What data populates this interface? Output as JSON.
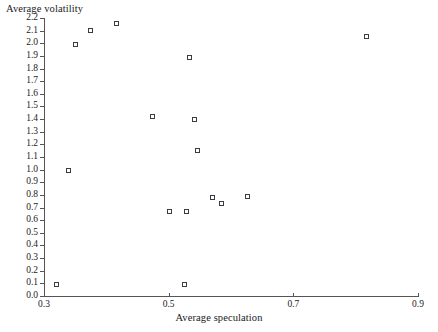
{
  "chart_data": {
    "type": "scatter",
    "title": "",
    "xlabel": "Average speculation",
    "ylabel": "Average volatility",
    "xlim": [
      0.3,
      0.9
    ],
    "ylim": [
      0.0,
      2.2
    ],
    "grid": false,
    "legend": null,
    "xticks": [
      "0.3",
      "0.5",
      "0.7",
      "0.9"
    ],
    "xtick_values": [
      0.3,
      0.5,
      0.7,
      0.9
    ],
    "yticks": [
      "0.0",
      "0.1",
      "0.2",
      "0.3",
      "0.4",
      "0.5",
      "0.6",
      "0.7",
      "0.8",
      "0.9",
      "1.0",
      "1.1",
      "1.2",
      "1.3",
      "1.4",
      "1.5",
      "1.6",
      "1.7",
      "1.8",
      "1.9",
      "2.0",
      "2.1",
      "2.2"
    ],
    "ytick_values": [
      0.0,
      0.1,
      0.2,
      0.3,
      0.4,
      0.5,
      0.6,
      0.7,
      0.8,
      0.9,
      1.0,
      1.1,
      1.2,
      1.3,
      1.4,
      1.5,
      1.6,
      1.7,
      1.8,
      1.9,
      2.0,
      2.1,
      2.2
    ],
    "marker": "open-square",
    "marker_color": "#3b3b44",
    "points": [
      {
        "x": 0.32,
        "y": 0.09
      },
      {
        "x": 0.34,
        "y": 0.99
      },
      {
        "x": 0.35,
        "y": 1.99
      },
      {
        "x": 0.374,
        "y": 2.1
      },
      {
        "x": 0.417,
        "y": 2.16
      },
      {
        "x": 0.474,
        "y": 1.42
      },
      {
        "x": 0.502,
        "y": 0.67
      },
      {
        "x": 0.525,
        "y": 0.09
      },
      {
        "x": 0.528,
        "y": 0.67
      },
      {
        "x": 0.534,
        "y": 1.89
      },
      {
        "x": 0.542,
        "y": 1.4
      },
      {
        "x": 0.546,
        "y": 1.15
      },
      {
        "x": 0.571,
        "y": 0.78
      },
      {
        "x": 0.584,
        "y": 0.73
      },
      {
        "x": 0.627,
        "y": 0.79
      },
      {
        "x": 0.818,
        "y": 2.05
      }
    ]
  }
}
